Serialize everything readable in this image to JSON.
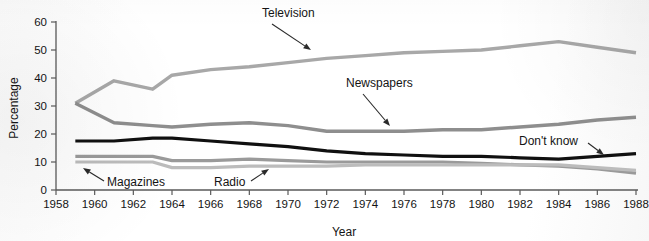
{
  "chart_data": {
    "type": "line",
    "title": "",
    "xlabel": "Year",
    "ylabel": "Percentage",
    "xlim": [
      1958,
      1988
    ],
    "ylim": [
      0,
      60
    ],
    "grid": false,
    "legend_position": "inline-annotations",
    "xticks": [
      1958,
      1960,
      1962,
      1964,
      1966,
      1968,
      1970,
      1972,
      1974,
      1976,
      1978,
      1980,
      1982,
      1984,
      1986,
      1988
    ],
    "yticks": [
      0,
      10,
      20,
      30,
      40,
      50,
      60
    ],
    "x": [
      1959,
      1961,
      1963,
      1964,
      1966,
      1968,
      1970,
      1972,
      1974,
      1976,
      1978,
      1980,
      1982,
      1984,
      1986,
      1988
    ],
    "series": [
      {
        "name": "Television",
        "color": "#a8a8a8",
        "width": 3.4,
        "values": [
          31,
          39,
          36,
          41,
          43,
          44,
          45.5,
          47,
          48,
          49,
          49.5,
          50,
          51.5,
          53,
          51,
          49
        ]
      },
      {
        "name": "Newspapers",
        "color": "#8e8e8e",
        "width": 3.4,
        "values": [
          31,
          24,
          23,
          22.5,
          23.5,
          24,
          23,
          21,
          21,
          21,
          21.5,
          21.5,
          22.5,
          23.5,
          25,
          26
        ]
      },
      {
        "name": "Don't know",
        "color": "#101010",
        "width": 3.2,
        "values": [
          17.5,
          17.5,
          18.5,
          18.5,
          17.5,
          16.5,
          15.5,
          14,
          13,
          12.5,
          12,
          12,
          11.5,
          11,
          12,
          13
        ]
      },
      {
        "name": "Magazines",
        "color": "#9a9a9a",
        "width": 3.2,
        "values": [
          12,
          12,
          12,
          10.5,
          10.5,
          11,
          10.5,
          10,
          10,
          10,
          10,
          9.5,
          9,
          8.5,
          7.5,
          6
        ]
      },
      {
        "name": "Radio",
        "color": "#bcbcbc",
        "width": 3.2,
        "values": [
          10,
          10,
          10,
          8,
          8,
          8.5,
          8.5,
          8.5,
          9,
          9,
          9,
          9,
          9,
          9,
          8,
          7
        ]
      }
    ],
    "annotations": [
      {
        "id": "television",
        "label": "Television",
        "label_x": 262,
        "label_y": 17,
        "arrow_x1": 272,
        "arrow_y1": 24,
        "arrow_x2": 311,
        "arrow_y2": 50
      },
      {
        "id": "newspapers",
        "label": "Newspapers",
        "label_x": 346,
        "label_y": 87,
        "arrow_x1": 363,
        "arrow_y1": 94,
        "arrow_x2": 390,
        "arrow_y2": 126
      },
      {
        "id": "dont-know",
        "label": "Don't know",
        "label_x": 519,
        "label_y": 145,
        "arrow_x1": 588,
        "arrow_y1": 143,
        "arrow_x2": 604,
        "arrow_y2": 155
      },
      {
        "id": "magazines",
        "label": "Magazines",
        "label_x": 107,
        "label_y": 186,
        "arrow_x1": 104,
        "arrow_y1": 181,
        "arrow_x2": 83,
        "arrow_y2": 168
      },
      {
        "id": "radio",
        "label": "Radio",
        "label_x": 214,
        "label_y": 186,
        "arrow_x1": 251,
        "arrow_y1": 181,
        "arrow_x2": 269,
        "arrow_y2": 169
      }
    ]
  },
  "axes": {
    "y_title": "Percentage",
    "x_title": "Year"
  }
}
